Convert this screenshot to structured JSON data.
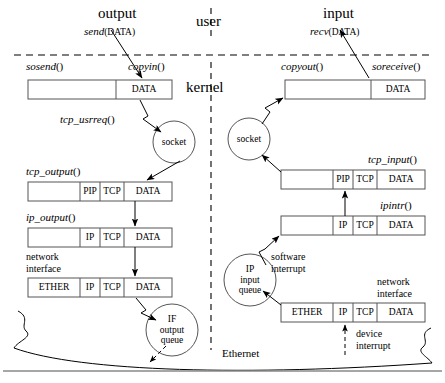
{
  "diagram": {
    "title_omitted": true,
    "layers": {
      "user": "user",
      "kernel": "kernel",
      "ethernet": "Ethernet"
    },
    "output_side": {
      "heading": "output",
      "syscall_fn": "send",
      "syscall_arg": "(DATA)",
      "copy_fn": "copyin",
      "functions": {
        "sosend": "sosend",
        "tcp_usrreq": "tcp_usrreq",
        "tcp_output": "tcp_output",
        "ip_output": "ip_output"
      },
      "network_interface_label": "network\ninterface",
      "network_interface_line1": "network",
      "network_interface_line2": "interface",
      "socket_label": "socket",
      "queue_label_line1": "IF",
      "queue_label_line2": "output",
      "queue_label_line3": "queue",
      "buffers": [
        {
          "name": "sosend-buffer",
          "cells": [
            {
              "label": "",
              "w": 88
            },
            {
              "label": "DATA",
              "w": 56
            }
          ]
        },
        {
          "name": "tcp-output-buffer",
          "cells": [
            {
              "label": "",
              "w": 52
            },
            {
              "label": "PIP",
              "w": 20
            },
            {
              "label": "TCP",
              "w": 24
            },
            {
              "label": "DATA",
              "w": 48
            }
          ]
        },
        {
          "name": "ip-output-buffer",
          "cells": [
            {
              "label": "",
              "w": 52
            },
            {
              "label": "IP",
              "w": 20
            },
            {
              "label": "TCP",
              "w": 24
            },
            {
              "label": "DATA",
              "w": 48
            }
          ]
        },
        {
          "name": "ether-buffer",
          "cells": [
            {
              "label": "ETHER",
              "w": 52
            },
            {
              "label": "IP",
              "w": 20
            },
            {
              "label": "TCP",
              "w": 24
            },
            {
              "label": "DATA",
              "w": 48
            }
          ]
        }
      ]
    },
    "input_side": {
      "heading": "input",
      "syscall_fn": "recv",
      "syscall_arg": "(DATA)",
      "copy_fn": "copyout",
      "functions": {
        "soreceive": "soreceive",
        "tcp_input": "tcp_input",
        "ipintr": "ipintr"
      },
      "network_interface_line1": "network",
      "network_interface_line2": "interface",
      "socket_label": "socket",
      "queue_label_line1": "IP",
      "queue_label_line2": "input",
      "queue_label_line3": "queue",
      "software_interrupt_line1": "software",
      "software_interrupt_line2": "interrupt",
      "device_interrupt_line1": "device",
      "device_interrupt_line2": "interrupt",
      "buffers": [
        {
          "name": "soreceive-buffer",
          "cells": [
            {
              "label": "",
              "w": 88
            },
            {
              "label": "DATA",
              "w": 56
            }
          ]
        },
        {
          "name": "tcp-input-buffer",
          "cells": [
            {
              "label": "",
              "w": 52
            },
            {
              "label": "PIP",
              "w": 20
            },
            {
              "label": "TCP",
              "w": 24
            },
            {
              "label": "DATA",
              "w": 48
            }
          ]
        },
        {
          "name": "ipintr-buffer",
          "cells": [
            {
              "label": "",
              "w": 52
            },
            {
              "label": "IP",
              "w": 20
            },
            {
              "label": "TCP",
              "w": 24
            },
            {
              "label": "DATA",
              "w": 48
            }
          ]
        },
        {
          "name": "ether-in-buffer",
          "cells": [
            {
              "label": "ETHER",
              "w": 52
            },
            {
              "label": "IP",
              "w": 20
            },
            {
              "label": "TCP",
              "w": 24
            },
            {
              "label": "DATA",
              "w": 48
            }
          ]
        }
      ]
    },
    "colors": {
      "line": "#000000",
      "background": "#ffffff",
      "box_stroke": "#555555"
    }
  }
}
